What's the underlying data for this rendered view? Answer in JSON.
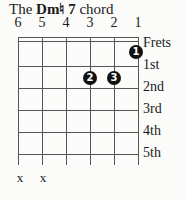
{
  "title": {
    "prefix": "The ",
    "chord": "Dm♮ 7",
    "suffix": " chord"
  },
  "string_numbers": [
    "6",
    "5",
    "4",
    "3",
    "2",
    "1"
  ],
  "fret_labels": [
    "Frets",
    "1st",
    "2nd",
    "3rd",
    "4th",
    "5th"
  ],
  "fingers": [
    {
      "label": "1",
      "string": 1,
      "fret": 1
    },
    {
      "label": "2",
      "string": 3,
      "fret": 2
    },
    {
      "label": "3",
      "string": 2,
      "fret": 2
    }
  ],
  "muted": [
    "x",
    "x"
  ]
}
